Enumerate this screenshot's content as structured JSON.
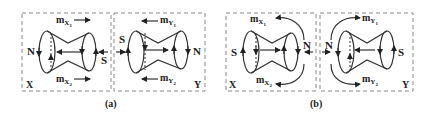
{
  "panels": [
    {
      "caption": "(a)",
      "boxes": [
        {
          "name": "X",
          "left_pole": "N",
          "right_pole": "S",
          "moment_top": {
            "label": "m",
            "sub": "X1",
            "sub_main": "X",
            "sub_idx": "1",
            "direction": "right"
          },
          "moment_bottom": {
            "label": "m",
            "sub": "X2",
            "sub_main": "X",
            "sub_idx": "2",
            "direction": "right"
          }
        },
        {
          "name": "Y",
          "left_pole": "S",
          "right_pole": "N",
          "moment_top": {
            "label": "m",
            "sub": "Y1",
            "sub_main": "Y",
            "sub_idx": "1",
            "direction": "left"
          },
          "moment_bottom": {
            "label": "m",
            "sub": "Y2",
            "sub_main": "Y",
            "sub_idx": "2",
            "direction": "left"
          }
        }
      ],
      "interface": "S-S facing, arrows pointing inward"
    },
    {
      "caption": "(b)",
      "boxes": [
        {
          "name": "X",
          "left_pole": "S",
          "right_pole": "N",
          "moment_top": {
            "label": "m",
            "sub": "X1",
            "sub_main": "X",
            "sub_idx": "1",
            "direction": "curved-left"
          },
          "moment_bottom": {
            "label": "m",
            "sub": "X2",
            "sub_main": "X",
            "sub_idx": "2",
            "direction": "curved-left"
          }
        },
        {
          "name": "Y",
          "left_pole": "N",
          "right_pole": "S",
          "moment_top": {
            "label": "m",
            "sub": "Y1",
            "sub_main": "Y",
            "sub_idx": "1",
            "direction": "curved-right"
          },
          "moment_bottom": {
            "label": "m",
            "sub": "Y2",
            "sub_main": "Y",
            "sub_idx": "2",
            "direction": "curved-right"
          }
        }
      ],
      "interface": "N-N facing, arrows pointing outward"
    }
  ]
}
